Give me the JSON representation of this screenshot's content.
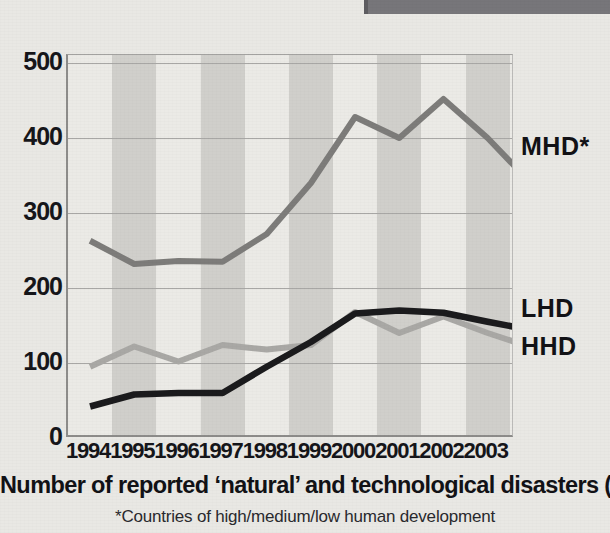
{
  "caption": "Number of reported ‘natural’ and technological disasters (1994-2003)",
  "footnote": "*Countries of high/medium/low human development",
  "series_labels": {
    "mhd": "MHD*",
    "lhd": "LHD",
    "hhd": "HHD"
  },
  "colors": {
    "mhd": "#7d7c7a",
    "lhd": "#1b1b1d",
    "hhd": "#a9a8a5",
    "band_dark": "#d0cfcb",
    "band_light": "#ebeae6",
    "gridline": "#a8a7a5",
    "axis": "#8d8c8a",
    "text": "#16161a",
    "corner_block": "#77767a"
  },
  "chart_data": {
    "type": "line",
    "title": "Number of reported ‘natural’ and technological disasters (1994-2003)",
    "subtitle": "*Countries of high/medium/low human development",
    "xlabel": "",
    "ylabel": "",
    "categories": [
      "1994",
      "1995",
      "1996",
      "1997",
      "1998",
      "1999",
      "2000",
      "2001",
      "2002",
      "2003"
    ],
    "x_tick_labels": [
      "1994",
      "1995",
      "1996",
      "1997",
      "1998",
      "1999",
      "2000",
      "2001",
      "2002",
      "2003"
    ],
    "y_tick_labels": [
      "0",
      "100",
      "200",
      "300",
      "400",
      "500"
    ],
    "y_ticks": [
      0,
      100,
      200,
      300,
      400,
      500
    ],
    "ylim": [
      0,
      500
    ],
    "grid": "horizontal",
    "legend": "right-inline-labels",
    "band_shading": "alternating vertical bands per year",
    "series": [
      {
        "name": "MHD*",
        "color": "#7d7c7a",
        "values": [
          263,
          232,
          236,
          235,
          272,
          340,
          428,
          400,
          452,
          400
        ],
        "end_value": 362
      },
      {
        "name": "LHD",
        "color": "#1b1b1d",
        "values": [
          42,
          58,
          60,
          60,
          95,
          128,
          166,
          170,
          167,
          155
        ],
        "end_value": 148
      },
      {
        "name": "HHD",
        "color": "#a9a8a5",
        "values": [
          95,
          122,
          102,
          124,
          118,
          124,
          168,
          140,
          162,
          140
        ],
        "end_value": 128
      }
    ]
  }
}
